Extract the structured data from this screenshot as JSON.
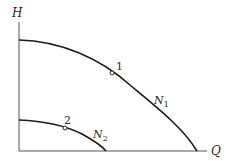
{
  "axes": {
    "y_label": "H",
    "x_label": "Q"
  },
  "curves": [
    {
      "name": "N",
      "subscript": "1",
      "point_label": "1"
    },
    {
      "name": "N",
      "subscript": "2",
      "point_label": "2"
    }
  ],
  "colors": {
    "stroke": "#1a1a1a",
    "axis": "#555555",
    "background": "#ffffff"
  }
}
